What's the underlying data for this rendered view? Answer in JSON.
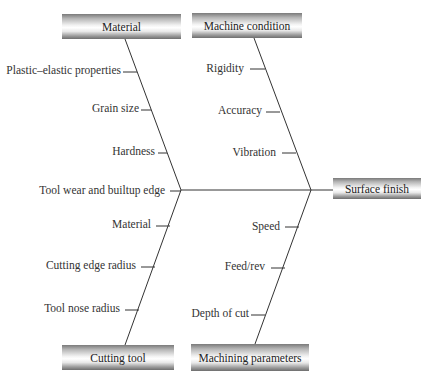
{
  "diagram": {
    "type": "fishbone",
    "effect": "Surface finish",
    "categories": [
      {
        "name": "Material",
        "position": "top-left",
        "causes": [
          "Plastic–elastic properties",
          "Grain size",
          "Hardness",
          "Tool wear and builtup edge"
        ]
      },
      {
        "name": "Machine condition",
        "position": "top-right",
        "causes": [
          "Rigidity",
          "Accuracy",
          "Vibration"
        ]
      },
      {
        "name": "Cutting tool",
        "position": "bottom-left",
        "causes": [
          "Material",
          "Cutting edge radius",
          "Tool nose radius"
        ]
      },
      {
        "name": "Machining parameters",
        "position": "bottom-right",
        "causes": [
          "Speed",
          "Feed/rev",
          "Depth of cut"
        ]
      }
    ]
  }
}
